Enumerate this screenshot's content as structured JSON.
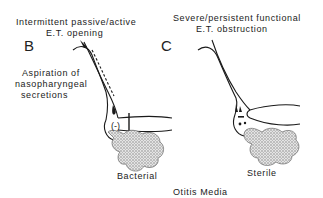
{
  "figure": {
    "caption": "Otitis Media",
    "panels": [
      {
        "letter": "B",
        "title_line1": "Intermittent passive/active",
        "title_line2": "E.T. opening",
        "side_label_line1": "Aspiration of",
        "side_label_line2": "nasopharyngeal",
        "side_label_line3": "secretions",
        "pressure_mark": "(-)",
        "result_label": "Bacterial"
      },
      {
        "letter": "C",
        "title_line1": "Severe/persistent functional",
        "title_line2": "E.T. obstruction",
        "pressure_mark": "",
        "result_label": "Sterile"
      }
    ]
  },
  "colors": {
    "line": "#1a1a1a",
    "effusion": "#b8b8b8"
  }
}
